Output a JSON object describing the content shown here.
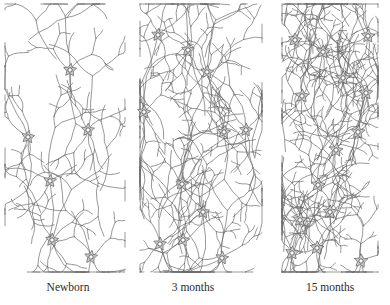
{
  "figure": {
    "panels": [
      {
        "label": "Newborn",
        "label_x": 38,
        "density": "sparse",
        "neurons": [
          [
            70,
            70
          ],
          [
            28,
            137
          ],
          [
            88,
            130
          ],
          [
            50,
            181
          ],
          [
            52,
            240
          ],
          [
            91,
            257
          ]
        ],
        "extra_branches": 4
      },
      {
        "label": "3 months",
        "label_x": 163,
        "density": "medium",
        "neurons": [
          [
            158,
            35
          ],
          [
            188,
            50
          ],
          [
            207,
            72
          ],
          [
            224,
            132
          ],
          [
            182,
            184
          ],
          [
            203,
            212
          ],
          [
            160,
            244
          ],
          [
            183,
            240
          ],
          [
            222,
            258
          ],
          [
            246,
            130
          ],
          [
            144,
            112
          ]
        ],
        "extra_branches": 16
      },
      {
        "label": "15 months",
        "label_x": 300,
        "density": "dense",
        "neurons": [
          [
            295,
            40
          ],
          [
            323,
            52
          ],
          [
            368,
            36
          ],
          [
            343,
            78
          ],
          [
            366,
            93
          ],
          [
            302,
            96
          ],
          [
            358,
            132
          ],
          [
            318,
            185
          ],
          [
            330,
            212
          ],
          [
            300,
            220
          ],
          [
            317,
            248
          ],
          [
            292,
            253
          ],
          [
            361,
            261
          ],
          [
            336,
            150
          ]
        ],
        "extra_branches": 45
      }
    ],
    "colors": {
      "soma_fill": "#cfcfcf",
      "line": "#6b6b6b",
      "label": "#2a2a2a"
    }
  }
}
